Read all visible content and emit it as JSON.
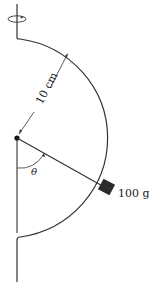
{
  "diagram": {
    "radius_label": "10 cm",
    "mass_label": "100 g",
    "angle_label": "θ",
    "colors": {
      "stroke": "#333333",
      "block": "#2b2b2b",
      "background": "#ffffff"
    },
    "icons": {
      "rotation": "rotation-arrow-icon"
    }
  }
}
